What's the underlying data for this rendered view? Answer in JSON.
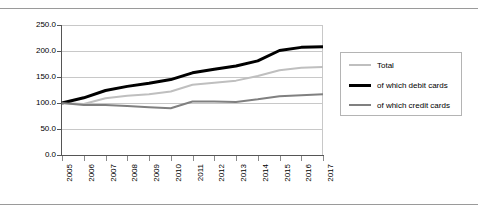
{
  "chart_data": {
    "type": "line",
    "title": "",
    "subtitle": "",
    "xlabel": "",
    "ylabel": "",
    "x": [
      2005,
      2006,
      2007,
      2008,
      2009,
      2010,
      2011,
      2012,
      2013,
      2014,
      2015,
      2016,
      2017
    ],
    "categories": [
      "2005",
      "2006",
      "2007",
      "2008",
      "2009",
      "2010",
      "2011",
      "2012",
      "2013",
      "2014",
      "2015",
      "2016",
      "2017"
    ],
    "ylim": [
      0.0,
      250.0
    ],
    "xlim": [
      2005,
      2017
    ],
    "yticks": [
      0.0,
      50.0,
      100.0,
      150.0,
      200.0,
      250.0
    ],
    "ytick_labels": [
      "0.0",
      "50.0",
      "100.0",
      "150.0",
      "200.0",
      "250.0"
    ],
    "grid": true,
    "grid_axis": "y",
    "legend_position": "right",
    "series": [
      {
        "name": "Total",
        "color": "#bfbfbf",
        "width": 2.0,
        "values": [
          100,
          98,
          109,
          114,
          117,
          122,
          135,
          139,
          143,
          152,
          163,
          168,
          169
        ]
      },
      {
        "name": "of which debit cards",
        "color": "#000000",
        "width": 3.0,
        "values": [
          100,
          110,
          124,
          132,
          138,
          145,
          158,
          165,
          171,
          181,
          201,
          207,
          208
        ]
      },
      {
        "name": "of which credit cards",
        "color": "#808080",
        "width": 2.0,
        "values": [
          100,
          96,
          96,
          94,
          92,
          90,
          103,
          103,
          102,
          107,
          113,
          115,
          117
        ]
      }
    ]
  },
  "legend": {
    "items": [
      {
        "label": "Total"
      },
      {
        "label": "of which debit cards"
      },
      {
        "label": "of which credit cards"
      }
    ]
  }
}
